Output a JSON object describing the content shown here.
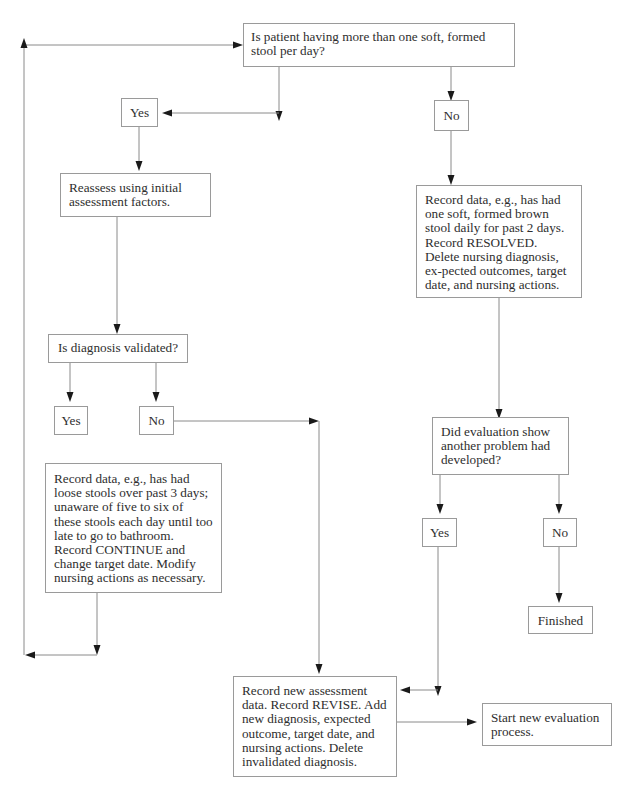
{
  "diagram": {
    "type": "flowchart",
    "nodes": {
      "q_stool": "Is patient having more than one soft, formed stool per day?",
      "yes_1": "Yes",
      "no_1": "No",
      "reassess": "Reassess using initial assessment factors.",
      "resolved": "Record data, e.g., has had one soft, formed brown stool daily for past 2 days. Record RESOLVED. Delete nursing diagnosis, ex-pected outcomes, target date, and nursing actions.",
      "q_validated": "Is diagnosis validated?",
      "yes_2": "Yes",
      "no_2": "No",
      "continue": "Record data, e.g., has had loose stools over past 3 days; unaware of five to six of these stools each day until too late to go to bathroom. Record CONTINUE and change target date. Modify nursing actions as necessary.",
      "q_another": "Did evaluation show another problem had developed?",
      "yes_3": "Yes",
      "no_3": "No",
      "finished": "Finished",
      "revise": "Record new assessment data. Record REVISE. Add new diagnosis, expected outcome, target date, and nursing actions. Delete invalidated diagnosis.",
      "new_eval": "Start new evaluation process."
    },
    "edges": [
      {
        "from": "q_stool",
        "to": "yes_1"
      },
      {
        "from": "q_stool",
        "to": "no_1"
      },
      {
        "from": "yes_1",
        "to": "reassess"
      },
      {
        "from": "no_1",
        "to": "resolved"
      },
      {
        "from": "reassess",
        "to": "q_validated"
      },
      {
        "from": "q_validated",
        "to": "yes_2"
      },
      {
        "from": "q_validated",
        "to": "no_2"
      },
      {
        "from": "no_2",
        "to": "revise"
      },
      {
        "from": "continue",
        "to": "q_stool"
      },
      {
        "from": "resolved",
        "to": "q_another"
      },
      {
        "from": "q_another",
        "to": "yes_3"
      },
      {
        "from": "q_another",
        "to": "no_3"
      },
      {
        "from": "no_3",
        "to": "finished"
      },
      {
        "from": "yes_3",
        "to": "revise"
      },
      {
        "from": "revise",
        "to": "new_eval"
      }
    ],
    "colors": {
      "line": "#8a8a8a",
      "arrowhead": "#1a1a1a",
      "box_border": "#9a9a9a",
      "text": "#2e2e2e"
    }
  }
}
